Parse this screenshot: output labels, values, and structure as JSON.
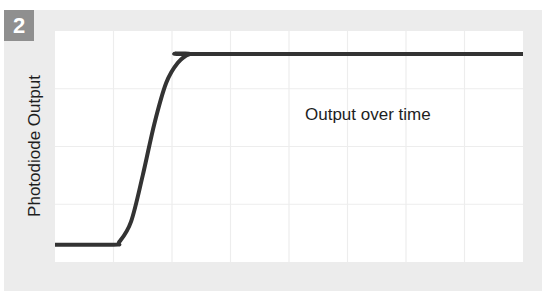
{
  "figure": {
    "panel_number": "2",
    "ylabel": "Photodiode Output",
    "annotation": "Output over time"
  },
  "colors": {
    "panel_bg": "#ececec",
    "badge_bg": "#8f8f8f",
    "plot_bg": "#ffffff",
    "grid": "#ededed",
    "curve": "#333333"
  },
  "chart_data": {
    "type": "line",
    "title": "",
    "panel_label": "2",
    "xlabel": "",
    "ylabel": "Photodiode Output",
    "annotations": [
      "Output over time"
    ],
    "xlim": [
      0,
      8
    ],
    "ylim": [
      0,
      4
    ],
    "grid": true,
    "grid_x_ticks": [
      1,
      2,
      3,
      4,
      5,
      6,
      7
    ],
    "grid_y_ticks": [
      1,
      2,
      3
    ],
    "tick_labels_shown": false,
    "legend": null,
    "series": [
      {
        "name": "Output over time",
        "x": [
          0,
          1.0,
          1.1,
          1.3,
          1.5,
          1.7,
          1.9,
          2.1,
          2.3,
          2.5,
          8.0
        ],
        "y": [
          0.3,
          0.3,
          0.35,
          0.7,
          1.5,
          2.4,
          3.1,
          3.45,
          3.6,
          3.6,
          3.6
        ]
      }
    ]
  }
}
